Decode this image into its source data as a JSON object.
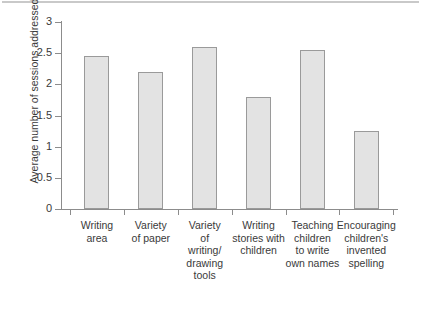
{
  "chart_data": {
    "type": "bar",
    "title": "",
    "subtitle": "",
    "xlabel": "",
    "ylabel": "Average number of sessions addressed",
    "ylim": [
      0,
      3
    ],
    "ytick_labels": [
      "0",
      "0.5",
      "1",
      "1.5",
      "2",
      "2.5",
      "3"
    ],
    "ytick_values": [
      0,
      0.5,
      1,
      1.5,
      2,
      2.5,
      3
    ],
    "grid": false,
    "legend": null,
    "categories": [
      "Writing area",
      "Variety of paper",
      "Variety of writing/ drawing tools",
      "Writing stories with children",
      "Teaching children to write own names",
      "Encouraging children's invented spelling"
    ],
    "category_lines": [
      [
        "Writing",
        "area"
      ],
      [
        "Variety",
        "of paper"
      ],
      [
        "Variety",
        "of",
        "writing/",
        "drawing",
        "tools"
      ],
      [
        "Writing",
        "stories with",
        "children"
      ],
      [
        "Teaching",
        "children",
        "to write",
        "own names"
      ],
      [
        "Encouraging",
        "children's",
        "invented",
        "spelling"
      ]
    ],
    "values": [
      2.45,
      2.2,
      2.6,
      1.8,
      2.55,
      1.25
    ],
    "bar_fill_color": "#e3e3e3",
    "bar_edge_color": "#9a9a9a",
    "axis_color": "#8c8c8c",
    "text_color": "#3a3a3a",
    "background_color": "#ffffff"
  }
}
